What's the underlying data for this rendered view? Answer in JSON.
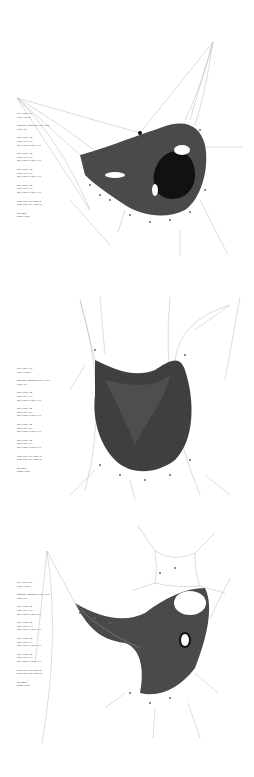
{
  "colors": {
    "background": "#ffffff",
    "mesh_dark": "#2a2a2a",
    "mesh_mid": "#555555",
    "cable": "#b8b8b8",
    "text": "#444444"
  },
  "panels": [
    {
      "id": "panel-1",
      "params": [
        {
          "lines": [
            "iter: 0427 / 1.5",
            "conv: 0.0148"
          ]
        },
        {
          "lines": [
            "stiffness / damping: 0.85 / 0.10",
            "relax: 0.0"
          ]
        },
        {
          "lines": [
            "anc: 0480 / 12",
            "rest: 0.50 / 1.0",
            "stp: 0.005 / 0.001 / 0.0"
          ]
        },
        {
          "lines": [
            "anc: 0480 / 12",
            "rest: 0.50 / 1.0",
            "stp: 0.005 / 0.001 / 0.0"
          ]
        },
        {
          "lines": [
            "anc: 0480 / 12",
            "rest: 0.50 / 1.0",
            "stp: 0.005 / 0.001 / 0.0"
          ]
        },
        {
          "lines": [
            "anc: 0480 / 12",
            "rest: 0.50 / 1.0",
            "stp: 0.005 / 0.001 / 0.0"
          ]
        },
        {
          "lines": [
            "node min: 0.5 / 2000 m",
            "node max: 3.0 / 2000 m"
          ]
        },
        {
          "lines": [
            "pts: 2304",
            "frame: 0001"
          ]
        }
      ]
    },
    {
      "id": "panel-2",
      "params": [
        {
          "lines": [
            "iter: 0427 / 1.5",
            "conv: 0.0148"
          ]
        },
        {
          "lines": [
            "stiffness / damping: 0.85 / 0.10",
            "relax: 0.0"
          ]
        },
        {
          "lines": [
            "anc: 0480 / 12",
            "rest: 0.50 / 1.0",
            "stp: 0.005 / 0.001 / 0.0"
          ]
        },
        {
          "lines": [
            "anc: 0480 / 12",
            "rest: 0.50 / 1.0",
            "stp: 0.005 / 0.001 / 0.0"
          ]
        },
        {
          "lines": [
            "anc: 0480 / 12",
            "rest: 0.50 / 1.0",
            "stp: 0.005 / 0.001 / 0.0"
          ]
        },
        {
          "lines": [
            "anc: 0480 / 12",
            "rest: 0.50 / 1.0",
            "stp: 0.005 / 0.001 / 0.0"
          ]
        },
        {
          "lines": [
            "node min: 0.5 / 2000 m",
            "node max: 3.0 / 2000 m"
          ]
        },
        {
          "lines": [
            "pts: 2304",
            "frame: 0002"
          ]
        }
      ]
    },
    {
      "id": "panel-3",
      "params": [
        {
          "lines": [
            "iter: 0427 / 1.5",
            "conv: 0.0148"
          ]
        },
        {
          "lines": [
            "stiffness / damping: 0.85 / 0.10",
            "relax: 0.0"
          ]
        },
        {
          "lines": [
            "anc: 0480 / 12",
            "rest: 0.50 / 1.0",
            "stp: 0.005 / 0.001 / 0.0"
          ]
        },
        {
          "lines": [
            "anc: 0480 / 12",
            "rest: 0.50 / 1.0",
            "stp: 0.005 / 0.001 / 0.0"
          ]
        },
        {
          "lines": [
            "anc: 0480 / 12",
            "rest: 0.50 / 1.0",
            "stp: 0.005 / 0.001 / 0.0"
          ]
        },
        {
          "lines": [
            "anc: 0480 / 12",
            "rest: 0.50 / 1.0",
            "stp: 0.005 / 0.001 / 0.0"
          ]
        },
        {
          "lines": [
            "node min: 0.5 / 2000 m",
            "node max: 3.0 / 2000 m"
          ]
        },
        {
          "lines": [
            "pts: 2304",
            "frame: 0003"
          ]
        }
      ]
    }
  ]
}
